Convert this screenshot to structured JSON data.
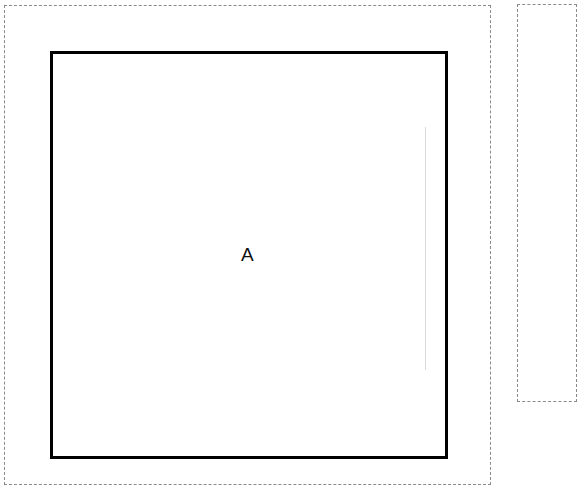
{
  "diagram": {
    "region_a": {
      "label": "A"
    },
    "colors": {
      "box_border": "#000000",
      "dashed_border": "#8a8a8a",
      "guide_line": "#d8d8d8"
    }
  }
}
